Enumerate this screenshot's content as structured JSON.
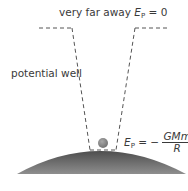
{
  "labels": {
    "far_away_prefix": "very far away ",
    "far_away_symbol": "E",
    "far_away_subscript": "P",
    "far_away_value": " = 0",
    "potential_well": "potential well",
    "surface_symbol": "E",
    "surface_subscript": "P",
    "surface_equals": " = − ",
    "surface_numerator": "GMm",
    "surface_denominator": "R"
  },
  "colors": {
    "dash": "#555555",
    "planet_top": "#5a5a5a",
    "planet_bottom": "#8a8a8a",
    "ball": "#8c8c8c",
    "text": "#3a3a3a"
  }
}
